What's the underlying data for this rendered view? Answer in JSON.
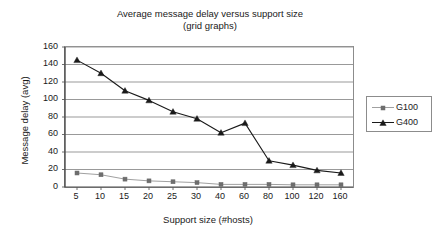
{
  "chart_data": {
    "type": "line",
    "title": "Average message delay versus support size",
    "subtitle": "(grid graphs)",
    "xlabel": "Support size (#hosts)",
    "ylabel": "Message delay (avg)",
    "categories": [
      "5",
      "10",
      "15",
      "20",
      "25",
      "30",
      "40",
      "60",
      "80",
      "100",
      "120",
      "160"
    ],
    "yticks": [
      "0",
      "20",
      "40",
      "60",
      "80",
      "100",
      "120",
      "140",
      "160"
    ],
    "ylim": [
      0,
      160
    ],
    "grid": "horizontal",
    "legend_position": "right",
    "series": [
      {
        "name": "G100",
        "color": "#a0a0a0",
        "marker": "square",
        "marker_color": "#6e6e6e",
        "values": [
          16,
          14,
          9,
          7,
          6,
          5,
          3,
          3,
          3,
          2.5,
          2.5,
          2.5
        ]
      },
      {
        "name": "G400",
        "color": "#1a1a1a",
        "marker": "triangle",
        "marker_color": "#1a1a1a",
        "values": [
          145,
          130,
          110,
          99,
          86,
          78,
          62,
          73,
          30,
          25,
          19,
          16
        ]
      }
    ]
  }
}
